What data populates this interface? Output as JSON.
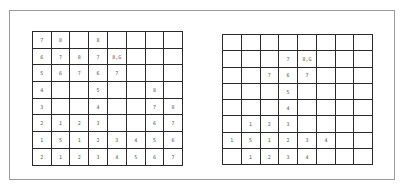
{
  "left_grid": {
    "rows": [
      [
        "7",
        "8",
        "",
        "8",
        "",
        "",
        "",
        ""
      ],
      [
        "6",
        "7",
        "8",
        "7",
        "8,G",
        "",
        "",
        ""
      ],
      [
        "5",
        "6",
        "7",
        "6",
        "7",
        "",
        "",
        ""
      ],
      [
        "4",
        "",
        "",
        "5",
        "",
        "",
        "8",
        ""
      ],
      [
        "3",
        "",
        "",
        "4",
        "",
        "",
        "7",
        "8"
      ],
      [
        "2",
        "1",
        "2",
        "3",
        "",
        "",
        "6",
        "7"
      ],
      [
        "1",
        "5",
        "1",
        "2",
        "3",
        "4",
        "5",
        "6"
      ],
      [
        "2",
        "1",
        "2",
        "3",
        "4",
        "5",
        "6",
        "7"
      ]
    ]
  },
  "right_grid": {
    "rows": [
      [
        "",
        "",
        "",
        "",
        "",
        "",
        "",
        ""
      ],
      [
        "",
        "",
        "",
        "7",
        "8,G",
        "",
        "",
        ""
      ],
      [
        "",
        "",
        "7",
        "6",
        "7",
        "",
        "",
        ""
      ],
      [
        "",
        "",
        "",
        "5",
        "",
        "",
        "",
        ""
      ],
      [
        "",
        "",
        "",
        "4",
        "",
        "",
        "",
        ""
      ],
      [
        "",
        "1",
        "2",
        "3",
        "",
        "",
        "",
        ""
      ],
      [
        "1",
        "5",
        "1",
        "2",
        "3",
        "4",
        "",
        ""
      ],
      [
        "",
        "1",
        "2",
        "3",
        "4",
        "",
        "",
        ""
      ]
    ]
  }
}
